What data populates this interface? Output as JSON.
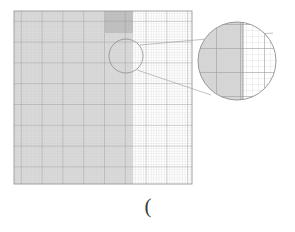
{
  "figure": {
    "kind": "mesh-grid-with-magnifier-callout",
    "background_color": "#ffffff",
    "caption_mark": "(",
    "domain_box": {
      "x": 14,
      "y": 11,
      "width": 178,
      "height": 173,
      "border_color": "#9a9a9a",
      "fill_color": "#ffffff"
    },
    "shaded_region": {
      "label": "left-shaded-subdomain",
      "x": 14,
      "y": 11,
      "width": 119,
      "height": 173,
      "fill_color": "#d4d4d4",
      "opacity": 0.85
    },
    "dark_band": {
      "label": "dark-top-band",
      "x": 105,
      "y": 11,
      "width": 28,
      "height": 22,
      "fill_color": "#bdbdbd"
    },
    "grid": {
      "minor_color": "#c9c9c9",
      "major_color": "#8f8f8f",
      "minor_step_x": 2.6,
      "minor_step_y": 2.6,
      "major_every": 8,
      "columns_minor": 68,
      "rows_minor": 66,
      "columns_major": 9,
      "rows_major": 9
    },
    "magnifier": {
      "source_circle": {
        "label": "source-detail-circle",
        "cx": 126,
        "cy": 56,
        "r": 17,
        "stroke_color": "#8d8d8d"
      },
      "target_circle": {
        "label": "magnified-detail-circle",
        "cx": 237,
        "cy": 61,
        "r": 39,
        "stroke_color": "#8d8d8d",
        "fill_color": "#ffffff"
      },
      "connector_color": "#9a9a9a",
      "zoom_factor": "2.3",
      "detail": {
        "shaded_fill": "#d6d6d6",
        "shaded_width_fraction": 0.58,
        "minor_color": "#cfcfcf",
        "major_color": "#8f8f8f",
        "minor_step": 6,
        "major_step": 24
      }
    }
  }
}
